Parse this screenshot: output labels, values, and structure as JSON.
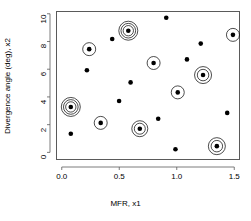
{
  "chart_data": {
    "type": "scatter",
    "title": "",
    "xlabel": "MFR, x1",
    "ylabel": "Divergence angle (deg), x2",
    "xlim": [
      -0.05,
      1.55
    ],
    "ylim": [
      -0.55,
      10.2
    ],
    "xticks": [
      0.0,
      0.5,
      1.0,
      1.5
    ],
    "xticklabels": [
      "0.0",
      "0.5",
      "1.0",
      "1.5"
    ],
    "yticks": [
      0,
      2,
      4,
      6,
      8,
      10
    ],
    "yticklabels": [
      "0",
      "2",
      "4",
      "6",
      "8",
      "10"
    ],
    "grid": false,
    "legend": false,
    "marker_color": "#000000",
    "halo_color": "#000000",
    "axis_color": "#5a5a5a",
    "points": [
      {
        "x": 0.07,
        "y": 3.35,
        "highlight": true,
        "rings": 3,
        "ring_outer": 9.5
      },
      {
        "x": 0.07,
        "y": 1.42,
        "highlight": false,
        "rings": 0,
        "ring_outer": 0
      },
      {
        "x": 0.21,
        "y": 6.0,
        "highlight": false,
        "rings": 0,
        "ring_outer": 0
      },
      {
        "x": 0.23,
        "y": 7.52,
        "highlight": true,
        "rings": 1,
        "ring_outer": 6.5
      },
      {
        "x": 0.33,
        "y": 2.2,
        "highlight": true,
        "rings": 1,
        "ring_outer": 6.5
      },
      {
        "x": 0.43,
        "y": 8.25,
        "highlight": false,
        "rings": 0,
        "ring_outer": 0
      },
      {
        "x": 0.49,
        "y": 3.78,
        "highlight": false,
        "rings": 0,
        "ring_outer": 0
      },
      {
        "x": 0.57,
        "y": 8.85,
        "highlight": true,
        "rings": 3,
        "ring_outer": 9.5
      },
      {
        "x": 0.59,
        "y": 5.12,
        "highlight": false,
        "rings": 0,
        "ring_outer": 0
      },
      {
        "x": 0.67,
        "y": 1.78,
        "highlight": true,
        "rings": 2,
        "ring_outer": 8.0
      },
      {
        "x": 0.79,
        "y": 6.52,
        "highlight": true,
        "rings": 1,
        "ring_outer": 6.5
      },
      {
        "x": 0.83,
        "y": 2.5,
        "highlight": false,
        "rings": 0,
        "ring_outer": 0
      },
      {
        "x": 0.9,
        "y": 9.78,
        "highlight": false,
        "rings": 0,
        "ring_outer": 0
      },
      {
        "x": 0.98,
        "y": 0.3,
        "highlight": false,
        "rings": 0,
        "ring_outer": 0
      },
      {
        "x": 1.0,
        "y": 4.4,
        "highlight": true,
        "rings": 1,
        "ring_outer": 6.5
      },
      {
        "x": 1.08,
        "y": 6.78,
        "highlight": false,
        "rings": 0,
        "ring_outer": 0
      },
      {
        "x": 1.2,
        "y": 7.92,
        "highlight": false,
        "rings": 0,
        "ring_outer": 0
      },
      {
        "x": 1.22,
        "y": 5.65,
        "highlight": true,
        "rings": 2,
        "ring_outer": 8.5
      },
      {
        "x": 1.34,
        "y": 0.52,
        "highlight": true,
        "rings": 2,
        "ring_outer": 8.5
      },
      {
        "x": 1.43,
        "y": 2.92,
        "highlight": false,
        "rings": 0,
        "ring_outer": 0
      },
      {
        "x": 1.48,
        "y": 8.55,
        "highlight": true,
        "rings": 1,
        "ring_outer": 6.5
      }
    ]
  }
}
